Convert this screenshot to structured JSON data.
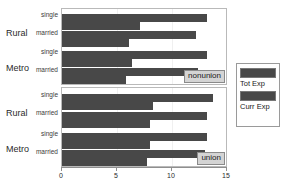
{
  "chart_data": {
    "type": "bar",
    "title": "",
    "xlabel": "",
    "ylabel": "",
    "xlim": [
      0,
      15
    ],
    "grid": false,
    "orientation": "horizontal",
    "legend_position": "right",
    "xticks": [
      0,
      5,
      10,
      15
    ],
    "xticklabels": [
      "0",
      "5",
      "10",
      "15"
    ],
    "series": [
      {
        "name": "Tot Exp",
        "color": "#484848"
      },
      {
        "name": "Curr Exp",
        "color": "#484848"
      }
    ],
    "panels": [
      {
        "strip_label": "nonunion",
        "groups": [
          {
            "label": "Rural",
            "rows": [
              {
                "label": "single",
                "values": {
                  "Tot Exp": 13.2,
                  "Curr Exp": 7.1
                }
              },
              {
                "label": "married",
                "values": {
                  "Tot Exp": 12.2,
                  "Curr Exp": 6.1
                }
              }
            ]
          },
          {
            "label": "Metro",
            "rows": [
              {
                "label": "single",
                "values": {
                  "Tot Exp": 13.2,
                  "Curr Exp": 6.4
                }
              },
              {
                "label": "married",
                "values": {
                  "Tot Exp": 12.4,
                  "Curr Exp": 5.8
                }
              }
            ]
          }
        ]
      },
      {
        "strip_label": "union",
        "groups": [
          {
            "label": "Rural",
            "rows": [
              {
                "label": "single",
                "values": {
                  "Tot Exp": 13.7,
                  "Curr Exp": 8.3
                }
              },
              {
                "label": "married",
                "values": {
                  "Tot Exp": 13.2,
                  "Curr Exp": 8.0
                }
              }
            ]
          },
          {
            "label": "Metro",
            "rows": [
              {
                "label": "single",
                "values": {
                  "Tot Exp": 13.2,
                  "Curr Exp": 8.0
                }
              },
              {
                "label": "married",
                "values": {
                  "Tot Exp": 13.0,
                  "Curr Exp": 7.7
                }
              }
            ]
          }
        ]
      }
    ]
  },
  "panels": {
    "nonunion": {
      "strip": "nonunion",
      "group_rural": "Rural",
      "group_metro": "Metro",
      "row_rural_single": "single",
      "row_rural_married": "married",
      "row_metro_single": "single",
      "row_metro_married": "married"
    },
    "union": {
      "strip": "union",
      "group_rural": "Rural",
      "group_metro": "Metro",
      "row_rural_single": "single",
      "row_rural_married": "married",
      "row_metro_single": "single",
      "row_metro_married": "married"
    }
  },
  "axis": {
    "tick_0": "0",
    "tick_5": "5",
    "tick_10": "10",
    "tick_15": "15"
  },
  "legend": {
    "entry_1": "Tot Exp",
    "entry_2": "Curr Exp"
  },
  "colors": {
    "bar": "#484848",
    "strip_bg": "#d4d4d4",
    "panel_border": "#b9b9b9",
    "axis": "#8f8f8f"
  }
}
